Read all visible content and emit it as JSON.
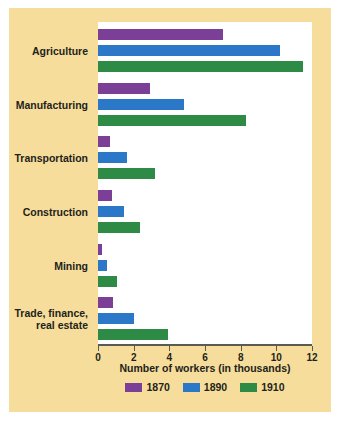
{
  "figure": {
    "panel_background": "#f6dd9b",
    "plot_background": "#ffffff",
    "axis_color": "#5a5a52",
    "text_color": "#231f1a"
  },
  "chart_data": {
    "type": "bar",
    "orientation": "horizontal",
    "title": "",
    "xlabel": "Number of workers (in thousands)",
    "ylabel": "",
    "xlim": [
      0,
      12
    ],
    "xticks": [
      0,
      2,
      4,
      6,
      8,
      10,
      12
    ],
    "xtick_labels": [
      "0",
      "2",
      "4",
      "6",
      "8",
      "10",
      "12"
    ],
    "grid": false,
    "legend_position": "bottom",
    "categories": [
      "Agriculture",
      "Manufacturing",
      "Transportation",
      "Construction",
      "Mining",
      "Trade, finance,\nreal estate"
    ],
    "series": [
      {
        "name": "1870",
        "color": "#7b3f98",
        "values": [
          7.0,
          2.9,
          0.7,
          0.8,
          0.2,
          0.85
        ]
      },
      {
        "name": "1890",
        "color": "#2c78c8",
        "values": [
          10.2,
          4.8,
          1.6,
          1.45,
          0.5,
          2.0
        ]
      },
      {
        "name": "1910",
        "color": "#2e8b45",
        "values": [
          11.5,
          8.3,
          3.2,
          2.35,
          1.05,
          3.9
        ]
      }
    ]
  },
  "legend": {
    "items": [
      {
        "label": "1870",
        "color": "#7b3f98"
      },
      {
        "label": "1890",
        "color": "#2c78c8"
      },
      {
        "label": "1910",
        "color": "#2e8b45"
      }
    ]
  }
}
